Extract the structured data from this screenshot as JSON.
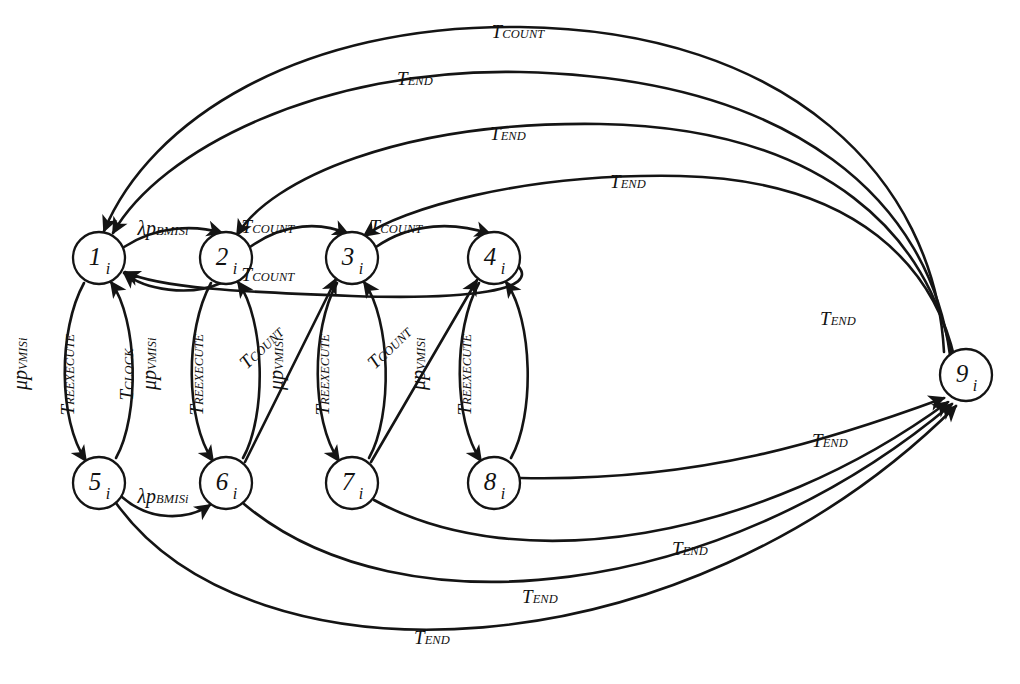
{
  "diagram": {
    "type": "state-transition-diagram",
    "title": "",
    "node_radius": 26,
    "stroke_color": "#141414",
    "background": "#ffffff",
    "nodes": [
      {
        "id": "n1",
        "label": "1",
        "sub": "i",
        "x": 99,
        "y": 258
      },
      {
        "id": "n2",
        "label": "2",
        "sub": "i",
        "x": 226,
        "y": 258
      },
      {
        "id": "n3",
        "label": "3",
        "sub": "i",
        "x": 352,
        "y": 258
      },
      {
        "id": "n4",
        "label": "4",
        "sub": "i",
        "x": 494,
        "y": 258
      },
      {
        "id": "n5",
        "label": "5",
        "sub": "i",
        "x": 99,
        "y": 483
      },
      {
        "id": "n6",
        "label": "6",
        "sub": "i",
        "x": 226,
        "y": 483
      },
      {
        "id": "n7",
        "label": "7",
        "sub": "i",
        "x": 352,
        "y": 483
      },
      {
        "id": "n8",
        "label": "8",
        "sub": "i",
        "x": 494,
        "y": 483
      },
      {
        "id": "n9",
        "label": "9",
        "sub": "i",
        "x": 966,
        "y": 375
      }
    ],
    "edge_labels": [
      {
        "id": "e_12",
        "from": "n1",
        "to": "n2",
        "base": "λp",
        "sub": "BMISi",
        "text": "λp_BMISi",
        "x": 163,
        "y": 228,
        "rot": 0
      },
      {
        "id": "e_23",
        "from": "n2",
        "to": "n3",
        "base": "T",
        "sub": "COUNT",
        "text": "T_COUNT",
        "x": 268,
        "y": 226,
        "rot": 0
      },
      {
        "id": "e_34",
        "from": "n3",
        "to": "n4",
        "base": "T",
        "sub": "COUNT",
        "text": "T_COUNT",
        "x": 396,
        "y": 226,
        "rot": 0
      },
      {
        "id": "e_41",
        "from": "n4",
        "to": "n1",
        "base": "T",
        "sub": "COUNT",
        "text": "T_COUNT",
        "x": 268,
        "y": 274,
        "rot": 0
      },
      {
        "id": "e_15",
        "from": "n1",
        "to": "n5",
        "base": "μp",
        "sub": "VMISi",
        "text": "μp_VMISi",
        "x": 36,
        "y": 400,
        "rot": -90
      },
      {
        "id": "e_51",
        "from": "n5",
        "to": "n1",
        "base": "T",
        "sub": "REEXECUTE",
        "text": "T_REEXECUTE",
        "x": 99,
        "y": 425,
        "rot": -90
      },
      {
        "id": "e_clk",
        "from": "n5",
        "to": "n1",
        "base": "T",
        "sub": "CLOCK",
        "text": "T_CLOCK",
        "x": 143,
        "y": 410,
        "rot": -90
      },
      {
        "id": "e_26",
        "from": "n2",
        "to": "n6",
        "base": "μp",
        "sub": "VMISi",
        "text": "μp_VMISi",
        "x": 165,
        "y": 400,
        "rot": -90
      },
      {
        "id": "e_62",
        "from": "n6",
        "to": "n2",
        "base": "T",
        "sub": "REEXECUTE",
        "text": "T_REEXECUTE",
        "x": 228,
        "y": 425,
        "rot": -90
      },
      {
        "id": "e_37",
        "from": "n3",
        "to": "n7",
        "base": "μp",
        "sub": "VMISi",
        "text": "μp_VMISi",
        "x": 292,
        "y": 400,
        "rot": -90
      },
      {
        "id": "e_73",
        "from": "n7",
        "to": "n3",
        "base": "T",
        "sub": "REEXECUTE",
        "text": "T_REEXECUTE",
        "x": 354,
        "y": 425,
        "rot": -90
      },
      {
        "id": "e_48",
        "from": "n4",
        "to": "n8",
        "base": "μp",
        "sub": "VMISi",
        "text": "μp_VMISi",
        "x": 434,
        "y": 400,
        "rot": -90
      },
      {
        "id": "e_84",
        "from": "n8",
        "to": "n4",
        "base": "T",
        "sub": "REEXECUTE",
        "text": "T_REEXECUTE",
        "x": 496,
        "y": 425,
        "rot": -90
      },
      {
        "id": "e_63",
        "from": "n6",
        "to": "n3",
        "base": "T",
        "sub": "COUNT",
        "text": "T_COUNT",
        "x": 262,
        "y": 368,
        "rot": -44
      },
      {
        "id": "e_74",
        "from": "n7",
        "to": "n4",
        "base": "T",
        "sub": "COUNT",
        "text": "T_COUNT",
        "x": 390,
        "y": 368,
        "rot": -44
      },
      {
        "id": "e_56",
        "from": "n5",
        "to": "n6",
        "base": "λp",
        "sub": "BMISi",
        "text": "λp_BMISi",
        "x": 163,
        "y": 496,
        "rot": 0
      },
      {
        "id": "e_a1",
        "from": "n4",
        "to": "n1",
        "base": "T",
        "sub": "COUNT",
        "text": "T_COUNT",
        "x": 518,
        "y": 31,
        "rot": 0
      },
      {
        "id": "e_a2",
        "from": "n3",
        "to": "n1",
        "base": "T",
        "sub": "END",
        "text": "T_END",
        "x": 415,
        "y": 78,
        "rot": 0
      },
      {
        "id": "e_a3",
        "from": "n2",
        "to": "n9",
        "base": "T",
        "sub": "END",
        "text": "T_END",
        "x": 508,
        "y": 133,
        "rot": 0
      },
      {
        "id": "e_a4",
        "from": "n3",
        "to": "n9",
        "base": "T",
        "sub": "END",
        "text": "T_END",
        "x": 628,
        "y": 181,
        "rot": 0
      },
      {
        "id": "e_a5",
        "from": "n4",
        "to": "n9",
        "base": "T",
        "sub": "END",
        "text": "T_END",
        "x": 838,
        "y": 318,
        "rot": 0
      },
      {
        "id": "e_b1",
        "from": "n8",
        "to": "n9",
        "base": "T",
        "sub": "END",
        "text": "T_END",
        "x": 830,
        "y": 440,
        "rot": 0
      },
      {
        "id": "e_b2",
        "from": "n7",
        "to": "n9",
        "base": "T",
        "sub": "END",
        "text": "T_END",
        "x": 690,
        "y": 548,
        "rot": 0
      },
      {
        "id": "e_b3",
        "from": "n6",
        "to": "n9",
        "base": "T",
        "sub": "END",
        "text": "T_END",
        "x": 540,
        "y": 596,
        "rot": 0
      },
      {
        "id": "e_b4",
        "from": "n5",
        "to": "n9",
        "base": "T",
        "sub": "END",
        "text": "T_END",
        "x": 432,
        "y": 637,
        "rot": 0
      }
    ],
    "edge_paths": [
      {
        "id": "p_12",
        "d": "M 124 247 C 158 225 196 225 222 233",
        "arrow": true,
        "w": 2.2
      },
      {
        "id": "p_21",
        "d": "M 221 283 C 190 297 145 290 124 273",
        "arrow": true,
        "w": 2.6
      },
      {
        "id": "p_23",
        "d": "M 250 247 C 285 222 322 222 348 234",
        "arrow": true,
        "w": 2.6
      },
      {
        "id": "p_34",
        "d": "M 376 247 C 412 222 455 222 490 234",
        "arrow": true,
        "w": 2.6
      },
      {
        "id": "p_41",
        "d": "M 518 266 C 540 290 470 300 352 296 C 240 292 160 288 125 272",
        "arrow": true,
        "w": 2.6
      },
      {
        "id": "p_15",
        "d": "M 84 283 C 58 330 58 420 86 461",
        "arrow": true,
        "w": 2.2
      },
      {
        "id": "p_51",
        "d": "M 116 458 C 140 415 138 320 111 282",
        "arrow": true,
        "w": 2.6
      },
      {
        "id": "p_26",
        "d": "M 211 283 C 185 330 185 420 213 461",
        "arrow": true,
        "w": 2.2
      },
      {
        "id": "p_62",
        "d": "M 243 458 C 267 415 265 320 238 282",
        "arrow": true,
        "w": 2.6
      },
      {
        "id": "p_37",
        "d": "M 337 283 C 311 330 311 420 339 461",
        "arrow": true,
        "w": 2.2
      },
      {
        "id": "p_73",
        "d": "M 369 458 C 393 415 391 320 364 282",
        "arrow": true,
        "w": 2.6
      },
      {
        "id": "p_48",
        "d": "M 479 283 C 453 330 453 420 481 461",
        "arrow": true,
        "w": 2.2
      },
      {
        "id": "p_84",
        "d": "M 511 458 C 535 415 533 320 506 282",
        "arrow": true,
        "w": 2.6
      },
      {
        "id": "p_63",
        "d": "M 245 462 L 336 279",
        "arrow": true,
        "w": 2.6
      },
      {
        "id": "p_74",
        "d": "M 371 462 L 477 280",
        "arrow": true,
        "w": 2.6
      },
      {
        "id": "p_56",
        "d": "M 122 497 C 150 522 188 520 210 505",
        "arrow": true,
        "w": 2.2
      },
      {
        "id": "p_a1",
        "d": "M 944 352 C 935 180 790 30 520 27 C 300 24 150 120 104 231",
        "arrow": true,
        "w": 2.6
      },
      {
        "id": "p_a2",
        "d": "M 950 355 C 930 205 800 78 520 72 C 320 68 160 150 113 233",
        "arrow": true,
        "w": 2.6
      },
      {
        "id": "p_a3",
        "d": "M 952 357 C 930 240 830 128 600 124 C 400 121 270 180 237 235",
        "arrow": true,
        "w": 2.6
      },
      {
        "id": "p_a4",
        "d": "M 955 360 C 935 270 860 180 680 176 C 520 173 400 210 364 236",
        "arrow": true,
        "w": 2.6
      },
      {
        "id": "p_b1",
        "d": "M 520 478 C 700 482 830 440 944 398",
        "arrow": true,
        "w": 2.6
      },
      {
        "id": "p_b2",
        "d": "M 374 500 C 520 580 760 540 948 402",
        "arrow": true,
        "w": 2.6
      },
      {
        "id": "p_b3",
        "d": "M 244 504 C 400 635 720 600 952 404",
        "arrow": true,
        "w": 2.6
      },
      {
        "id": "p_b4",
        "d": "M 116 503 C 250 690 680 680 956 406",
        "arrow": true,
        "w": 2.6
      }
    ]
  }
}
